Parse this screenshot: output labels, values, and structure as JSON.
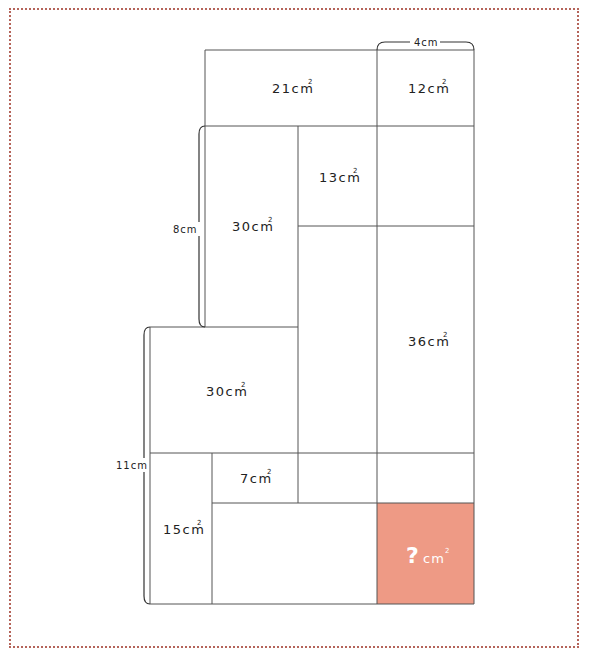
{
  "figure": {
    "type": "area-puzzle",
    "border_color": "#b5645a",
    "line_color": "#555555",
    "highlight_color": "#ee9a85",
    "regions": [
      {
        "id": "r21",
        "label": "21cm",
        "sup": "2"
      },
      {
        "id": "r12",
        "label": "12cm",
        "sup": "2"
      },
      {
        "id": "r30a",
        "label": "30cm",
        "sup": "2"
      },
      {
        "id": "r13",
        "label": "13cm",
        "sup": "2"
      },
      {
        "id": "r36",
        "label": "36cm",
        "sup": "2"
      },
      {
        "id": "r30b",
        "label": "30cm",
        "sup": "2"
      },
      {
        "id": "r7",
        "label": "7cm",
        "sup": "2"
      },
      {
        "id": "r15",
        "label": "15cm",
        "sup": "2"
      },
      {
        "id": "unknown",
        "label": "?",
        "unit": "cm",
        "sup": "2"
      }
    ],
    "dimensions": [
      {
        "id": "top",
        "label": "4cm"
      },
      {
        "id": "left-upper",
        "label": "8cm"
      },
      {
        "id": "left-lower",
        "label": "11cm"
      }
    ]
  }
}
